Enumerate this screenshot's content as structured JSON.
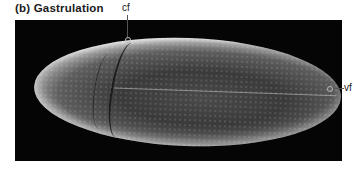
{
  "figure": {
    "title": "(b)  Gastrulation",
    "labels": {
      "cephalic_furrow": "cf",
      "ventral_furrow": "vf"
    },
    "image_description": "Scanning electron micrograph of a Drosophila embryo during gastrulation on black background"
  }
}
